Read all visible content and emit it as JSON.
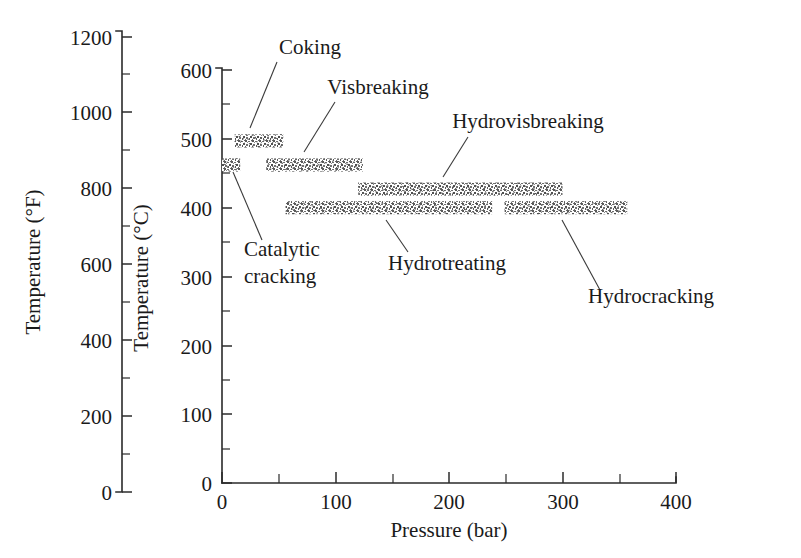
{
  "chart_data": {
    "type": "bar",
    "orientation": "horizontal-range",
    "title": "",
    "xlabel": "Pressure (bar)",
    "ylabel": "Temperature (°C)",
    "ylabel_secondary": "Temperature (°F)",
    "xlim": [
      0,
      400
    ],
    "ylim": [
      0,
      600
    ],
    "ylim_secondary": [
      0,
      1200
    ],
    "grid": false,
    "legend": "none",
    "xticks": [
      0,
      50,
      100,
      150,
      200,
      250,
      300,
      350,
      400
    ],
    "xtick_labels": [
      "0",
      "",
      "100",
      "",
      "200",
      "",
      "300",
      "",
      "400"
    ],
    "yticks": [
      0,
      50,
      100,
      150,
      200,
      250,
      300,
      350,
      400,
      450,
      500,
      550,
      600
    ],
    "ytick_labels": [
      "0",
      "",
      "100",
      "",
      "200",
      "",
      "300",
      "",
      "400",
      "",
      "500",
      "",
      "600"
    ],
    "yticks_secondary": [
      0,
      100,
      200,
      300,
      400,
      500,
      600,
      700,
      800,
      900,
      1000,
      1100,
      1200
    ],
    "ytick_labels_secondary": [
      "0",
      "",
      "200",
      "",
      "400",
      "",
      "600",
      "",
      "800",
      "",
      "1000",
      "",
      "1200"
    ],
    "bar_color": "#8a8a8a",
    "bar_texture": "speckled-gray",
    "series": [
      {
        "name": "Coking",
        "label": "Coking",
        "pressure_min": 11,
        "pressure_max": 54,
        "temperature_c": 497,
        "bar_height_c": 19,
        "label_x": 310,
        "label_y": 54,
        "label_anchor": "middle",
        "leader_from_x": 277,
        "leader_from_y": 62,
        "leader_to_x": 250,
        "leader_to_y": 128
      },
      {
        "name": "Visbreaking",
        "label": "Visbreaking",
        "pressure_min": 39,
        "pressure_max": 124,
        "temperature_c": 462,
        "bar_height_c": 19,
        "label_x": 378,
        "label_y": 94,
        "label_anchor": "middle",
        "leader_from_x": 335,
        "leader_from_y": 102,
        "leader_to_x": 304,
        "leader_to_y": 152
      },
      {
        "name": "Catalytic cracking",
        "label_line1": "Catalytic",
        "label_line2": "cracking",
        "pressure_min": 0,
        "pressure_max": 16,
        "temperature_c": 462,
        "bar_height_c": 19,
        "label_x": 244,
        "label_y": 256,
        "label_anchor": "start",
        "leader_from_x": 262,
        "leader_from_y": 240,
        "leader_to_x": 233,
        "leader_to_y": 172
      },
      {
        "name": "Hydrovisbreaking",
        "label": "Hydrovisbreaking",
        "pressure_min": 120,
        "pressure_max": 300,
        "temperature_c": 427,
        "bar_height_c": 19,
        "label_x": 528,
        "label_y": 128,
        "label_anchor": "middle",
        "leader_from_x": 468,
        "leader_from_y": 137,
        "leader_to_x": 443,
        "leader_to_y": 177
      },
      {
        "name": "Hydrotreating",
        "label": "Hydrotreating",
        "pressure_min": 56,
        "pressure_max": 238,
        "temperature_c": 400,
        "bar_height_c": 19,
        "label_x": 447,
        "label_y": 270,
        "label_anchor": "middle",
        "leader_from_x": 408,
        "leader_from_y": 252,
        "leader_to_x": 386,
        "leader_to_y": 220
      },
      {
        "name": "Hydrocracking",
        "label": "Hydrocracking",
        "pressure_min": 249,
        "pressure_max": 357,
        "temperature_c": 400,
        "bar_height_c": 19,
        "label_x": 651,
        "label_y": 303,
        "label_anchor": "middle",
        "leader_from_x": 600,
        "leader_from_y": 290,
        "leader_to_x": 562,
        "leader_to_y": 220
      }
    ]
  },
  "axes": {
    "fahrenheit_axis": {
      "title": "Temperature (°F)",
      "labels": [
        "1200",
        "1000",
        "800",
        "600",
        "400",
        "200",
        "0"
      ]
    },
    "celsius_axis": {
      "title": "Temperature (°C)",
      "labels": [
        "600",
        "500",
        "400",
        "300",
        "200",
        "100",
        "0"
      ]
    },
    "pressure_axis": {
      "title": "Pressure (bar)",
      "labels": [
        "0",
        "100",
        "200",
        "300",
        "400"
      ]
    }
  }
}
